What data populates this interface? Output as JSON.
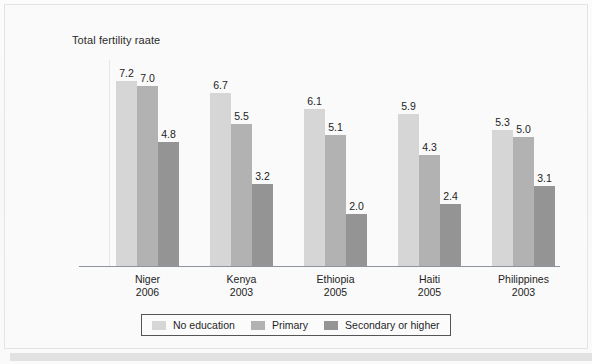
{
  "figure": {
    "title": "Total fertility raate",
    "bottom_band": ""
  },
  "chart_data": {
    "type": "bar",
    "title": "Total fertility raate",
    "xlabel": "",
    "ylabel": "Total fertility raate",
    "ylim": [
      0,
      8
    ],
    "grid": false,
    "legend_position": "bottom",
    "categories": [
      "Niger\n2006",
      "Kenya\n2003",
      "Ethiopia\n2005",
      "Haiti\n2005",
      "Philippines\n2003"
    ],
    "category_names": [
      "Niger",
      "Kenya",
      "Ethiopia",
      "Haiti",
      "Philippines"
    ],
    "category_years": [
      "2006",
      "2003",
      "2005",
      "2005",
      "2003"
    ],
    "series": [
      {
        "name": "No education",
        "color": "#d6d6d6",
        "values": [
          7.2,
          6.7,
          6.1,
          5.9,
          5.3
        ]
      },
      {
        "name": "Primary",
        "color": "#b2b2b2",
        "values": [
          7.0,
          5.5,
          5.1,
          4.3,
          5.0
        ]
      },
      {
        "name": "Secondary or higher",
        "color": "#949494",
        "values": [
          4.8,
          3.2,
          2.0,
          2.4,
          3.1
        ]
      }
    ],
    "value_labels": [
      [
        "7.2",
        "7.0",
        "4.8"
      ],
      [
        "6.7",
        "5.5",
        "3.2"
      ],
      [
        "6.1",
        "5.1",
        "2.0"
      ],
      [
        "5.9",
        "4.3",
        "2.4"
      ],
      [
        "5.3",
        "5.0",
        "3.1"
      ]
    ]
  },
  "legend": {
    "items": [
      {
        "label": "No education",
        "color": "#d6d6d6"
      },
      {
        "label": "Primary",
        "color": "#b2b2b2"
      },
      {
        "label": "Secondary or higher",
        "color": "#949494"
      }
    ]
  }
}
